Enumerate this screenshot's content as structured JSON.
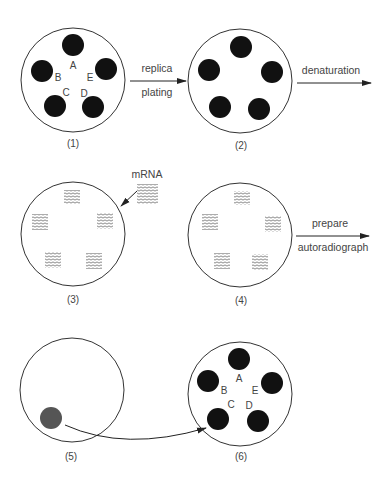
{
  "diagram": {
    "dishes": [
      {
        "id": "1",
        "label": "(1)",
        "cx": 73,
        "cy": 80,
        "r": 52,
        "content": "colonies",
        "colonies": [
          {
            "letter": "A",
            "cx": 73,
            "cy": 45,
            "lx": 73,
            "ly": 69
          },
          {
            "letter": "B",
            "cx": 42,
            "cy": 71,
            "lx": 58,
            "ly": 81
          },
          {
            "letter": "E",
            "cx": 106,
            "cy": 69,
            "lx": 90,
            "ly": 81
          },
          {
            "letter": "C",
            "cx": 55,
            "cy": 106,
            "lx": 66,
            "ly": 96
          },
          {
            "letter": "D",
            "cx": 93,
            "cy": 107,
            "lx": 84,
            "ly": 97
          }
        ]
      },
      {
        "id": "2",
        "label": "(2)",
        "cx": 240,
        "cy": 81,
        "r": 52,
        "content": "colonies",
        "colonies": [
          {
            "letter": "",
            "cx": 241,
            "cy": 47
          },
          {
            "letter": "",
            "cx": 209,
            "cy": 70
          },
          {
            "letter": "",
            "cx": 272,
            "cy": 72
          },
          {
            "letter": "",
            "cx": 220,
            "cy": 107
          },
          {
            "letter": "",
            "cx": 259,
            "cy": 109
          }
        ]
      },
      {
        "id": "3",
        "label": "(3)",
        "cx": 73,
        "cy": 234,
        "r": 52,
        "content": "mrna-blots",
        "blots": [
          {
            "x": 64,
            "y": 190
          },
          {
            "x": 32,
            "y": 214
          },
          {
            "x": 97,
            "y": 213
          },
          {
            "x": 45,
            "y": 252
          },
          {
            "x": 86,
            "y": 253
          }
        ]
      },
      {
        "id": "4",
        "label": "(4)",
        "cx": 240,
        "cy": 235,
        "r": 52,
        "content": "mrna-blots",
        "blots": [
          {
            "x": 234,
            "y": 191
          },
          {
            "x": 202,
            "y": 214
          },
          {
            "x": 265,
            "y": 216
          },
          {
            "x": 214,
            "y": 253
          },
          {
            "x": 252,
            "y": 254
          }
        ]
      },
      {
        "id": "5",
        "label": "(5)",
        "cx": 72,
        "cy": 390,
        "r": 52,
        "content": "spot",
        "spot": {
          "cx": 51,
          "cy": 418,
          "r": 11,
          "color": "#555555"
        }
      },
      {
        "id": "6",
        "label": "(6)",
        "cx": 240,
        "cy": 394,
        "r": 52,
        "content": "colonies",
        "colonies": [
          {
            "letter": "A",
            "cx": 239,
            "cy": 359,
            "lx": 239,
            "ly": 382
          },
          {
            "letter": "B",
            "cx": 208,
            "cy": 381,
            "lx": 224,
            "ly": 394
          },
          {
            "letter": "E",
            "cx": 272,
            "cy": 383,
            "lx": 255,
            "ly": 394
          },
          {
            "letter": "C",
            "cx": 218,
            "cy": 419,
            "lx": 231,
            "ly": 408
          },
          {
            "letter": "D",
            "cx": 258,
            "cy": 421,
            "lx": 249,
            "ly": 409
          }
        ]
      }
    ],
    "steps": [
      {
        "id": "replica-plating",
        "line1": "replica",
        "line2": "plating",
        "x1": 130,
        "x2": 186,
        "y": 81
      },
      {
        "id": "denaturation",
        "line1": "denaturation",
        "line2": "",
        "x1": 297,
        "x2": 371,
        "y": 83
      },
      {
        "id": "prepare-autoradiograph",
        "line1": "prepare",
        "line2": "autoradiograph",
        "x1": 296,
        "x2": 369,
        "y": 236
      }
    ],
    "mrna": {
      "label": "mRNA"
    },
    "colors": {
      "line": "#333333",
      "colony": "#111111",
      "text": "#444444",
      "blot": "#555555"
    }
  }
}
